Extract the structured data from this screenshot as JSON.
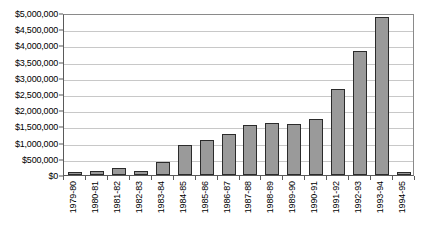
{
  "chart_data": {
    "type": "bar",
    "title": "",
    "subtitle": "",
    "xlabel": "",
    "ylabel": "",
    "ylim": [
      0,
      5000000
    ],
    "grid": true,
    "legend": "none",
    "orientation": "vertical",
    "bar_fill_color": "#9a9a9a",
    "bar_border_color": "#2b2b2b",
    "gridline_color": "#c8c8c8",
    "axis_color": "#5a5a5a",
    "y_tick_labels": [
      "$0",
      "$500,000",
      "$1,000,000",
      "$1,500,000",
      "$2,000,000",
      "$2,500,000",
      "$3,000,000",
      "$3,500,000",
      "$4,000,000",
      "$4,500,000",
      "$5,000,000"
    ],
    "y_tick_values": [
      0,
      500000,
      1000000,
      1500000,
      2000000,
      2500000,
      3000000,
      3500000,
      4000000,
      4500000,
      5000000
    ],
    "categories": [
      "1979-80",
      "1980-81",
      "1981-82",
      "1982-83",
      "1983-84",
      "1984-85",
      "1985-86",
      "1986-87",
      "1987-88",
      "1988-89",
      "1989-90",
      "1990-91",
      "1991-92",
      "1992-93",
      "1993-94",
      "1994-95"
    ],
    "values": [
      80000,
      110000,
      210000,
      110000,
      390000,
      930000,
      1080000,
      1280000,
      1540000,
      1600000,
      1570000,
      1730000,
      2670000,
      3820000,
      4890000,
      50000
    ]
  }
}
